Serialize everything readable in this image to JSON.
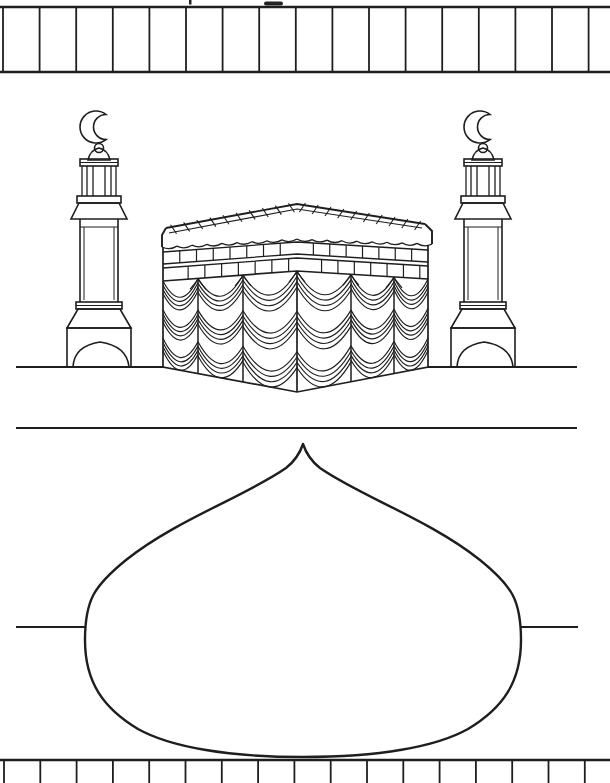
{
  "page": {
    "background": "#ffffff",
    "ink_color": "#1e1e1e",
    "kind_label": "kaaba-coloring-page"
  },
  "borders": {
    "top": {
      "stripe_line_count": 17,
      "start_x": 3,
      "spacing": 36.6,
      "band_top_y": 7,
      "band_bottom_y": 72
    },
    "bottom": {
      "stripe_line_count": 17,
      "start_x": 4,
      "spacing": 36.3,
      "band_top_y": 760,
      "band_bottom_y": 783
    }
  },
  "illustration": {
    "minaret_count": 2,
    "kiswa_drape": {
      "columns": 6,
      "rows": 3,
      "curves_per_swag": 4
    },
    "belt_panel_divisions_per_face": 8,
    "valance_scallops_per_face": 9,
    "roof_hatch_ticks_per_slope": 10,
    "ground_line_y": 367,
    "divider_line_y": 428,
    "dome_side_line_y": 627
  }
}
